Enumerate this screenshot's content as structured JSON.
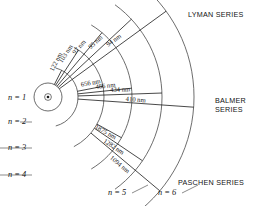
{
  "figure": {
    "nucleus": {
      "cx": 48,
      "cy": 97,
      "label": "nucleus"
    },
    "stroke_color": "#3c3c3c",
    "transition_color": "#1a1a1a",
    "text_color": "#131313"
  },
  "shells": [
    {
      "id": "n1",
      "label": "n = 1",
      "radius": 14,
      "lx": 8,
      "ly": 93
    },
    {
      "id": "n2",
      "label": "n = 2",
      "radius": 30,
      "lx": 8,
      "ly": 117
    },
    {
      "id": "n3",
      "label": "n = 3",
      "radius": 56,
      "lx": 8,
      "ly": 143
    },
    {
      "id": "n4",
      "label": "n = 4",
      "radius": 84,
      "lx": 8,
      "ly": 170
    },
    {
      "id": "n5",
      "label": "n = 5",
      "radius": 114,
      "lx": 108,
      "ly": 188
    },
    {
      "id": "n6",
      "label": "n = 6",
      "radius": 146,
      "lx": 158,
      "ly": 188
    }
  ],
  "series": [
    {
      "id": "lyman",
      "name": "LYMAN SERIES",
      "lines": [
        "LYMAN SERIES"
      ],
      "lx": 188,
      "ly": 10,
      "transitions": [
        {
          "label": "122 nm",
          "from": 2,
          "to": 1,
          "angle": -63
        },
        {
          "label": "103 nm",
          "from": 3,
          "to": 1,
          "angle": -57
        },
        {
          "label": "97 nm",
          "from": 4,
          "to": 1,
          "angle": -50
        },
        {
          "label": "95 nm",
          "from": 5,
          "to": 1,
          "angle": -43
        },
        {
          "label": "94 nm",
          "from": 6,
          "to": 1,
          "angle": -36
        }
      ]
    },
    {
      "id": "balmer",
      "name": "BALMER SERIES",
      "lines": [
        "BALMER",
        "SERIES"
      ],
      "lx": 215,
      "ly": 96,
      "transitions": [
        {
          "label": "656 nm",
          "from": 3,
          "to": 2,
          "angle": -11
        },
        {
          "label": "486 nm",
          "from": 4,
          "to": 2,
          "angle": -6
        },
        {
          "label": "434 nm",
          "from": 5,
          "to": 2,
          "angle": -2
        },
        {
          "label": "410 nm",
          "from": 6,
          "to": 2,
          "angle": 4
        }
      ]
    },
    {
      "id": "paschen",
      "name": "PASCHEN SERIES",
      "lines": [
        "PASCHEN SERIES"
      ],
      "lx": 178,
      "ly": 178,
      "transitions": [
        {
          "label": "1875 nm",
          "from": 4,
          "to": 3,
          "angle": 29
        },
        {
          "label": "1282 nm",
          "from": 5,
          "to": 3,
          "angle": 34
        },
        {
          "label": "1094 nm",
          "from": 6,
          "to": 3,
          "angle": 40
        }
      ]
    }
  ]
}
